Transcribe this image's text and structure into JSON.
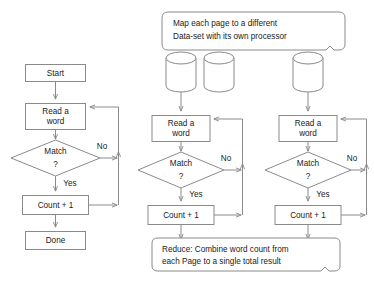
{
  "diagram": {
    "colors": {
      "stroke": "#8a8a8a",
      "fill": "#ffffff",
      "text": "#1a1a1a",
      "background": "#ffffff"
    },
    "banners": {
      "map": {
        "line1": "Map each page to a  different",
        "line2": "Data-set with its own processor"
      },
      "reduce": {
        "line1": "Reduce: Combine word count from",
        "line2": " each Page to a single total result"
      }
    },
    "serial_flow": {
      "start": "Start",
      "read_line1": "Read a",
      "read_line2": "word",
      "decision_line1": "Match",
      "decision_line2": "?",
      "edge_no": "No",
      "edge_yes": "Yes",
      "count": "Count + 1",
      "done": "Done"
    },
    "parallel_flow_1": {
      "read_line1": "Read a",
      "read_line2": "word",
      "decision_line1": "Match",
      "decision_line2": "?",
      "edge_no": "No",
      "edge_yes": "Yes",
      "count": "Count + 1"
    },
    "parallel_flow_2": {
      "read_line1": "Read a",
      "read_line2": "word",
      "decision_line1": "Match",
      "decision_line2": "?",
      "edge_no": "No",
      "edge_yes": "Yes",
      "count": "Count + 1"
    },
    "datastores": {
      "count": 3,
      "icon": "cylinder-database-icon"
    }
  }
}
